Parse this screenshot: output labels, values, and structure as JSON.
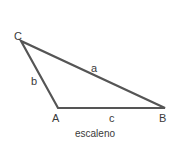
{
  "diagram": {
    "title": "escaleno",
    "stroke_color": "#555555",
    "vertices": {
      "A": {
        "label": "A"
      },
      "B": {
        "label": "B"
      },
      "C": {
        "label": "C"
      }
    },
    "sides": {
      "a": {
        "label": "a"
      },
      "b": {
        "label": "b"
      },
      "c": {
        "label": "c"
      }
    }
  }
}
